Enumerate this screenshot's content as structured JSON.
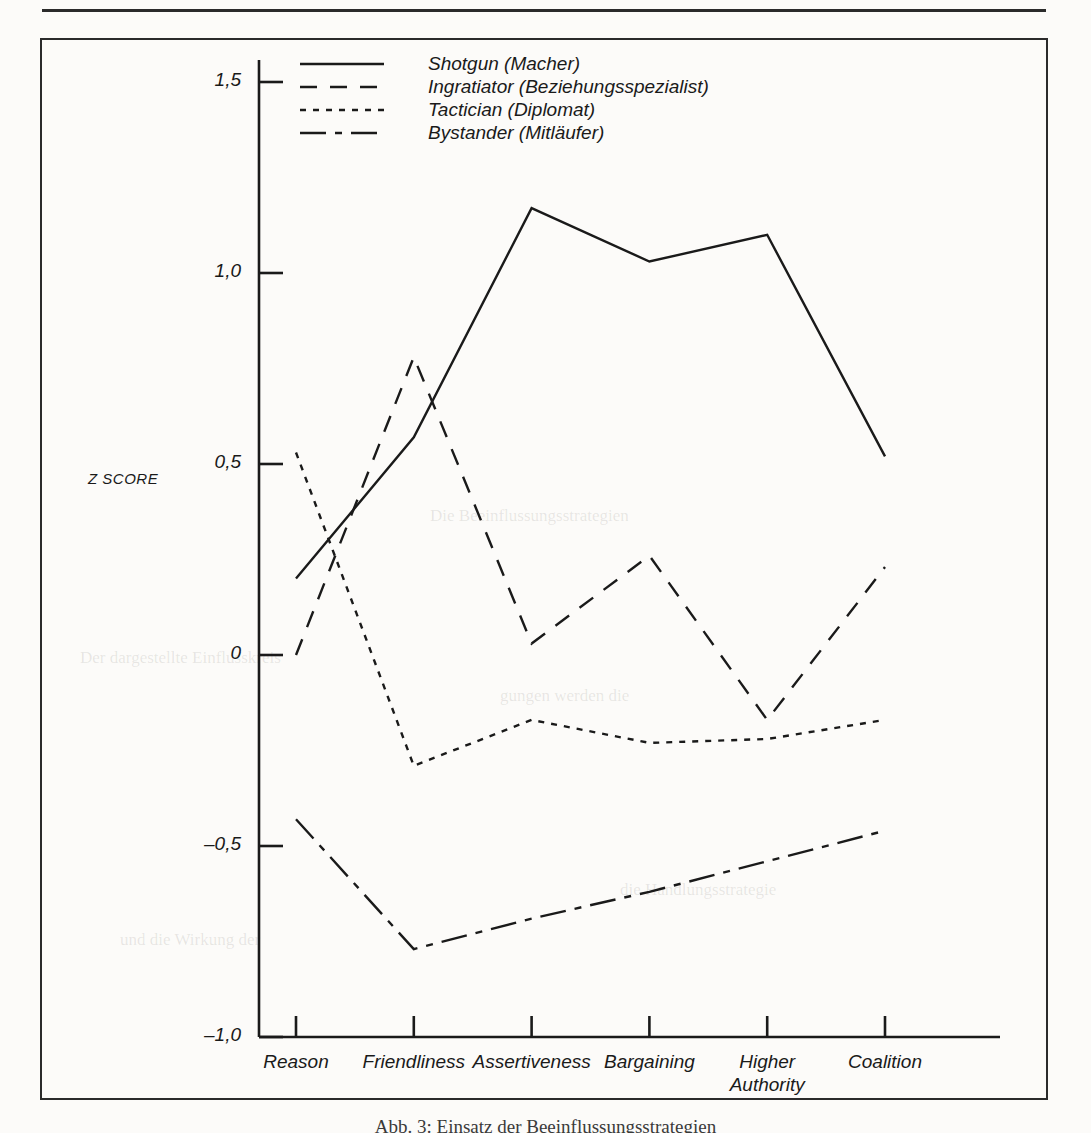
{
  "figure": {
    "caption": "Abb. 3: Einsatz der Beeinflussungsstrategien"
  },
  "legend": {
    "position": "top-center-inside",
    "items": [
      {
        "label": "Shotgun (Macher)",
        "style": "solid",
        "icon": "solid-line-icon"
      },
      {
        "label": "Ingratiator (Beziehungsspezialist)",
        "style": "dashed",
        "icon": "dashed-line-icon"
      },
      {
        "label": "Tactician (Diplomat)",
        "style": "dotted",
        "icon": "dotted-line-icon"
      },
      {
        "label": "Bystander (Mitläufer)",
        "style": "dashdot",
        "icon": "dashdot-line-icon"
      }
    ]
  },
  "axes": {
    "ylabel": "Z SCORE",
    "yticklabels": [
      "1,5",
      "1,0",
      "0,5",
      "0",
      "-0,5",
      "-1,0"
    ],
    "yticks": [
      1.5,
      1.0,
      0.5,
      0.0,
      -0.5,
      -1.0
    ],
    "xticklabels": [
      "Reason",
      "Friendliness",
      "Assertiveness",
      "Bargaining",
      "Higher\nAuthority",
      "Coalition"
    ]
  },
  "chart_data": {
    "type": "line",
    "title": "",
    "xlabel": "",
    "ylabel": "Z SCORE",
    "categories": [
      "Reason",
      "Friendliness",
      "Assertiveness",
      "Bargaining",
      "Higher Authority",
      "Coalition"
    ],
    "ylim": [
      -1.0,
      1.5
    ],
    "yticks": [
      -1.0,
      -0.5,
      0.0,
      0.5,
      1.0,
      1.5
    ],
    "grid": false,
    "legend_position": "top-center",
    "series": [
      {
        "name": "Shotgun (Macher)",
        "style": "solid",
        "values": [
          0.2,
          0.57,
          1.17,
          1.03,
          1.1,
          0.52
        ]
      },
      {
        "name": "Ingratiator (Beziehungsspezialist)",
        "style": "dashed",
        "values": [
          0.0,
          0.78,
          0.03,
          0.26,
          -0.17,
          0.23
        ]
      },
      {
        "name": "Tactician (Diplomat)",
        "style": "dotted",
        "values": [
          0.53,
          -0.29,
          -0.17,
          -0.23,
          -0.22,
          -0.17
        ]
      },
      {
        "name": "Bystander (Mitläufer)",
        "style": "dashdot",
        "values": [
          -0.43,
          -0.77,
          -0.69,
          -0.62,
          -0.54,
          -0.46
        ]
      }
    ]
  },
  "colors": {
    "ink": "#1a1a1a",
    "frame": "#2b2b2b",
    "paper": "#fcfbf9"
  },
  "ghost_text": [
    "Die Beeinflussungsstrategien",
    "Der dargestellte Einflusskreis",
    "gungen werden die",
    "die Handlungsstrategie",
    "und die Wirkung der"
  ]
}
